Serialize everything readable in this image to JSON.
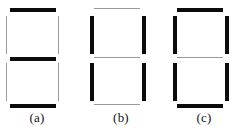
{
  "figure": {
    "kind": "seven-segment-diagram",
    "background_color": "#ffffff",
    "thick_color": "#0b0b0b",
    "thin_color": "#9a9a9a",
    "segment_order": [
      "top",
      "top-left",
      "top-right",
      "middle",
      "bottom-left",
      "bottom-right",
      "bottom"
    ],
    "panels": [
      {
        "caption": "(a)",
        "description": "horizontal segments bold, vertical segments faint",
        "segments": {
          "top": "thick",
          "top_left": "thin",
          "top_right": "thin",
          "middle": "thick",
          "bottom_left": "thin",
          "bottom_right": "thin",
          "bottom": "thick"
        }
      },
      {
        "caption": "(b)",
        "description": "vertical segments bold, horizontal segments faint",
        "segments": {
          "top": "thin",
          "top_left": "thick",
          "top_right": "thick",
          "middle": "thin",
          "bottom_left": "thick",
          "bottom_right": "thick",
          "bottom": "thin"
        }
      },
      {
        "caption": "(c)",
        "description": "all vertical segments and outer horizontals bold, middle horizontal faint",
        "segments": {
          "top": "thick",
          "top_left": "thick",
          "top_right": "thick",
          "middle": "thin",
          "bottom_left": "thick",
          "bottom_right": "thick",
          "bottom": "thick"
        }
      }
    ]
  }
}
